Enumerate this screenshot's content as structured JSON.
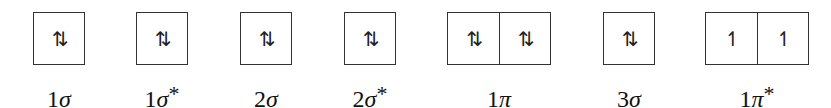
{
  "diagram": {
    "title": "",
    "orbitals": [
      {
        "id": "1sigma",
        "label_num": "1",
        "label_sym": "σ",
        "label_star": "",
        "boxes": [
          "⇅"
        ]
      },
      {
        "id": "1sigma-star",
        "label_num": "1",
        "label_sym": "σ",
        "label_star": "*",
        "boxes": [
          "⇅"
        ]
      },
      {
        "id": "2sigma",
        "label_num": "2",
        "label_sym": "σ",
        "label_star": "",
        "boxes": [
          "⇅"
        ]
      },
      {
        "id": "2sigma-star",
        "label_num": "2",
        "label_sym": "σ",
        "label_star": "*",
        "boxes": [
          "⇅"
        ]
      },
      {
        "id": "1pi",
        "label_num": "1",
        "label_sym": "π",
        "label_star": "",
        "boxes": [
          "⇅",
          "⇅"
        ]
      },
      {
        "id": "3sigma",
        "label_num": "3",
        "label_sym": "σ",
        "label_star": "",
        "boxes": [
          "⇅"
        ]
      },
      {
        "id": "1pi-star",
        "label_num": "1",
        "label_sym": "π",
        "label_star": "*",
        "boxes": [
          "↿",
          "↿"
        ]
      }
    ],
    "electron_glyphs": {
      "paired": "⇅",
      "single_up": "↿"
    }
  }
}
